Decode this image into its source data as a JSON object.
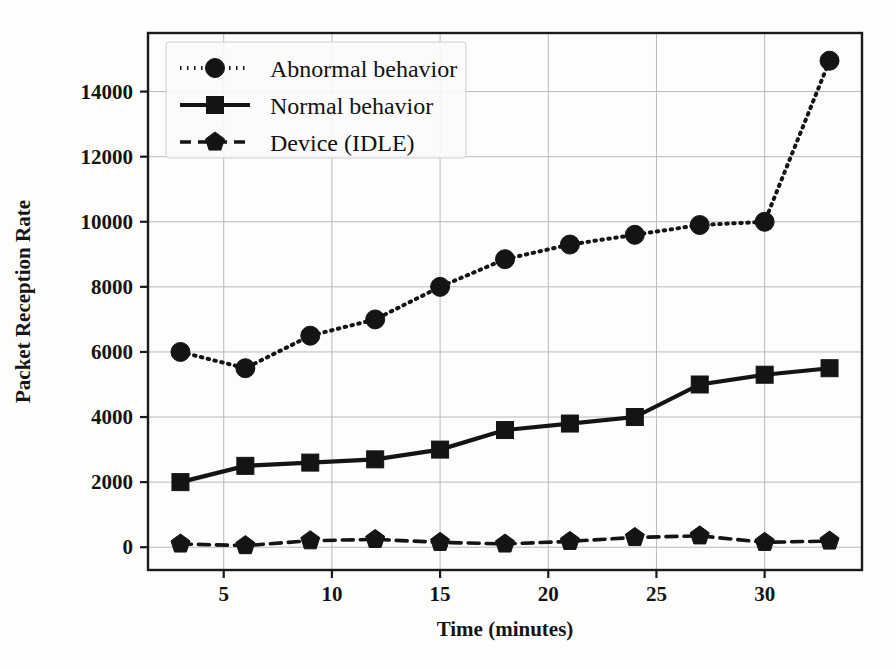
{
  "chart_data": {
    "type": "line",
    "title": "",
    "xlabel": "Time (minutes)",
    "ylabel": "Packet Reception Rate",
    "x": [
      3,
      6,
      9,
      12,
      15,
      18,
      21,
      24,
      27,
      30,
      33
    ],
    "xlim": [
      1.5,
      34.5
    ],
    "ylim": [
      -700,
      15800
    ],
    "xticks": [
      5,
      10,
      15,
      20,
      25,
      30
    ],
    "xtick_labels": [
      "5",
      "10",
      "15",
      "20",
      "25",
      "30"
    ],
    "yticks": [
      0,
      2000,
      4000,
      6000,
      8000,
      10000,
      12000,
      14000
    ],
    "ytick_labels": [
      "0",
      "2000",
      "4000",
      "6000",
      "8000",
      "10000",
      "12000",
      "14000"
    ],
    "grid": true,
    "legend_position": "upper left",
    "series": [
      {
        "name": "Abnormal behavior",
        "marker": "circle",
        "linestyle": "dotted",
        "color": "#141414",
        "values": [
          6000,
          5500,
          6500,
          7000,
          8000,
          8850,
          9300,
          9600,
          9900,
          10000,
          14950
        ]
      },
      {
        "name": "Normal behavior",
        "marker": "square",
        "linestyle": "solid",
        "color": "#141414",
        "values": [
          2000,
          2500,
          2600,
          2700,
          3000,
          3600,
          3800,
          4000,
          5000,
          5300,
          5500
        ]
      },
      {
        "name": "Device (IDLE)",
        "marker": "pentagon",
        "linestyle": "dashed",
        "color": "#141414",
        "values": [
          100,
          50,
          200,
          240,
          150,
          100,
          180,
          300,
          350,
          150,
          190
        ]
      }
    ]
  }
}
